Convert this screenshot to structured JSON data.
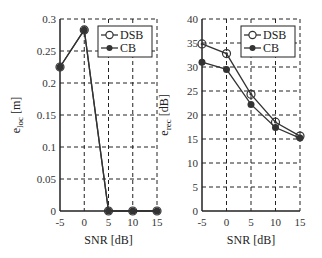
{
  "chart_data": [
    {
      "type": "line",
      "title": "",
      "xlabel": "SNR [dB]",
      "ylabel": "e_loc [m]",
      "ylabel_main": "e",
      "ylabel_sub": "loc",
      "ylabel_unit": "[m]",
      "x": [
        -5,
        0,
        5,
        10,
        15
      ],
      "xlim": [
        -5,
        15
      ],
      "ylim": [
        0,
        0.3
      ],
      "xticks": [
        "-5",
        "0",
        "5",
        "10",
        "15"
      ],
      "yticks": [
        "0",
        "0.05",
        "0.1",
        "0.15",
        "0.2",
        "0.25",
        "0.3"
      ],
      "grid": true,
      "legend_position": "upper right",
      "series": [
        {
          "name": "DSB",
          "marker": "open-circle",
          "values": [
            0.225,
            0.283,
            0,
            0,
            0
          ]
        },
        {
          "name": "CB",
          "marker": "filled-circle",
          "values": [
            0.225,
            0.283,
            0,
            0,
            0
          ]
        }
      ]
    },
    {
      "type": "line",
      "title": "",
      "xlabel": "SNR [dB]",
      "ylabel": "e_rec [dB]",
      "ylabel_main": "e",
      "ylabel_sub": "rec",
      "ylabel_unit": "[dB]",
      "x": [
        -5,
        0,
        5,
        10,
        15
      ],
      "xlim": [
        -5,
        15
      ],
      "ylim": [
        0,
        40
      ],
      "xticks": [
        "-5",
        "0",
        "5",
        "10",
        "15"
      ],
      "yticks": [
        "0",
        "5",
        "10",
        "15",
        "20",
        "25",
        "30",
        "35",
        "40"
      ],
      "grid": true,
      "legend_position": "upper right",
      "series": [
        {
          "name": "DSB",
          "marker": "open-circle",
          "values": [
            34.8,
            32.8,
            24.3,
            18.5,
            15.6
          ]
        },
        {
          "name": "CB",
          "marker": "filled-circle",
          "values": [
            31.0,
            29.5,
            22.2,
            17.4,
            15.2
          ]
        }
      ]
    }
  ]
}
